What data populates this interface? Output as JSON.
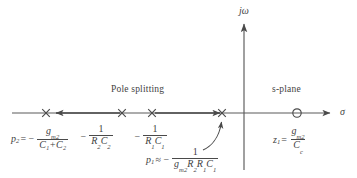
{
  "figure": {
    "type": "s-plane pole-zero diagram",
    "axes": {
      "imaginary_label": "jω",
      "real_label": "σ"
    },
    "annotations": {
      "pole_splitting": "Pole splitting",
      "s_plane": "s-plane"
    },
    "labels": {
      "p2": {
        "lhs_var": "p",
        "lhs_sub": "2",
        "equals": "=",
        "minus": "−",
        "numerator_var": "g",
        "numerator_sub": "m2",
        "denominator": "C₁+C₂"
      },
      "rc2": {
        "minus": "−",
        "numerator": "1",
        "denominator_var_a": "R",
        "denominator_sub_a": "2",
        "denominator_var_b": "C",
        "denominator_sub_b": "2"
      },
      "rc1": {
        "minus": "−",
        "numerator": "1",
        "denominator_var_a": "R",
        "denominator_sub_a": "1",
        "denominator_var_b": "C",
        "denominator_sub_b": "1"
      },
      "p1": {
        "lhs_var": "p",
        "lhs_sub": "1",
        "approx": "≈",
        "minus": "−",
        "numerator": "1",
        "denominator": "gm2R2R1C1"
      },
      "z1": {
        "lhs_var": "z",
        "lhs_sub": "1",
        "equals": "=",
        "numerator_var": "g",
        "numerator_sub": "m2",
        "denominator_var": "C",
        "denominator_sub": "c"
      }
    },
    "markers": {
      "poles": [
        {
          "name": "p2-pole-marker",
          "x": 46,
          "symbol": "x"
        },
        {
          "name": "rc2-pole-marker",
          "x": 122,
          "symbol": "x"
        },
        {
          "name": "rc1-pole-marker",
          "x": 152,
          "symbol": "x"
        },
        {
          "name": "p1-pole-marker",
          "x": 222,
          "symbol": "x"
        }
      ],
      "zeros": [
        {
          "name": "z1-zero-marker",
          "x": 297,
          "symbol": "o"
        }
      ]
    },
    "colors": {
      "line": "#5a5a5a",
      "text": "#3f3f3f",
      "background": "#ffffff"
    }
  }
}
